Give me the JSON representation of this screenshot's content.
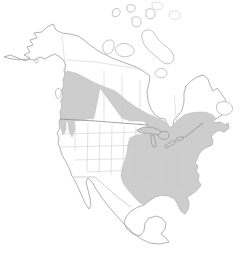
{
  "meta": {
    "title": "North America range map"
  },
  "map": {
    "description": "Outline map of North America with a gray shaded range: a band from coastal British Columbia and Washington across the Canadian Prairies to the Great Lakes, southern Ontario, southern Quebec and the Maritimes, joined to a large block covering the eastern United States from the Great Plains to the Atlantic coast, the Gulf Coast and Florida",
    "shaded_regions": [
      {
        "name": "northwestern-band",
        "areas": "coastal British Columbia, interior BC, two Washington lobes, prairie band sweeping southeast to the Great Lakes"
      },
      {
        "name": "eastern-block",
        "areas": "eastern United States, southern Ontario and Quebec, New Brunswick and Nova Scotia, Gulf Coast, Florida"
      }
    ],
    "unshaded_areas": "Alaska, Arctic islands, northern Canada, Hudson Bay, western United States, central Great Plains wedge, area northwest of Lake Superior, Mexico, Newfoundland",
    "colors": {
      "background": "#ffffff",
      "range_fill": "#cdcdcd",
      "range_edge": "#bdbdbd",
      "coast_line": "#9e9e9e",
      "state_line": "#c9c9c9",
      "border_line": "#8c8c8c",
      "island_line": "#ababab",
      "lake_line": "#949494"
    }
  }
}
